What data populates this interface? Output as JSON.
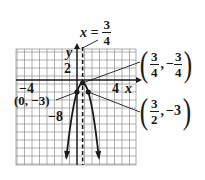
{
  "chart_data": {
    "type": "line",
    "title": "",
    "function": "f(x) = -4x^2 + 6x - 3",
    "xlabel": "x",
    "ylabel": "y",
    "xlim": [
      -8,
      8
    ],
    "ylim": [
      -21,
      8
    ],
    "grid": true,
    "x_tick_labels": [
      {
        "value": -4,
        "label": "−4"
      },
      {
        "value": 4,
        "label": "4"
      }
    ],
    "y_tick_labels": [
      {
        "value": 2,
        "label": "2"
      },
      {
        "value": -8,
        "label": "−8"
      }
    ],
    "axis_of_symmetry": {
      "x": 0.75,
      "label": "x = 3/4",
      "style": "dashed"
    },
    "points": [
      {
        "x": 0.75,
        "y": -0.75,
        "label": "(3/4, −3/4)",
        "role": "vertex"
      },
      {
        "x": 0,
        "y": -3,
        "label": "(0, −3)",
        "role": "y-intercept"
      },
      {
        "x": 1.5,
        "y": -3,
        "label": "(3/2, −3)",
        "role": "symmetric point"
      }
    ],
    "series": [
      {
        "name": "parabola",
        "x": [
          -1.5,
          -1,
          -0.5,
          0,
          0.25,
          0.5,
          0.75,
          1,
          1.25,
          1.5,
          2,
          2.5,
          3
        ],
        "values": [
          -21,
          -13,
          -7,
          -3,
          -1.75,
          -1,
          -0.75,
          -1,
          -1.75,
          -3,
          -7,
          -13,
          -21
        ]
      }
    ],
    "colors": {
      "ink": "#1a1a1a",
      "grid": "#9a9a9a",
      "background": "#ffffff"
    }
  },
  "labels": {
    "axis_x": "x",
    "axis_y": "y",
    "tick_x_neg4": "−4",
    "tick_x_4": "4",
    "tick_y_2": "2",
    "tick_y_neg8": "−8",
    "sym_prefix": "x =",
    "sym_num": "3",
    "sym_den": "4",
    "vertex": {
      "x_num": "3",
      "x_den": "4",
      "sep": ",",
      "y_sign": "−",
      "y_num": "3",
      "y_den": "4"
    },
    "y_intercept": "(0, −3)",
    "sym_point": {
      "x_num": "3",
      "x_den": "2",
      "sep": ",",
      "y": "−3"
    },
    "lparen": "(",
    "rparen": ")"
  }
}
